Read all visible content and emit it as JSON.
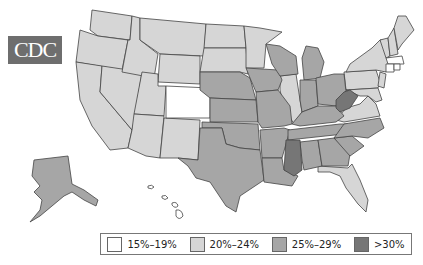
{
  "logo": {
    "text": "CDC"
  },
  "legend": {
    "items": [
      {
        "label": "15%–19%",
        "color": "#ffffff"
      },
      {
        "label": "20%–24%",
        "color": "#d6d6d6"
      },
      {
        "label": "25%–29%",
        "color": "#a6a6a6"
      },
      {
        "label": ">30%",
        "color": "#767676"
      }
    ]
  },
  "map": {
    "title": "",
    "categories": {
      "15-19": [
        "Colorado",
        "Massachusetts",
        "Connecticut",
        "Rhode Island",
        "Hawaii"
      ],
      "20-24": [
        "Washington",
        "Oregon",
        "California",
        "Nevada",
        "Idaho",
        "Montana",
        "Wyoming",
        "Utah",
        "Arizona",
        "New Mexico",
        "North Dakota",
        "South Dakota",
        "Minnesota",
        "Illinois",
        "Virginia",
        "Pennsylvania",
        "New York",
        "New Jersey",
        "Maryland",
        "Delaware",
        "Vermont",
        "New Hampshire",
        "Maine",
        "Florida"
      ],
      "25-29": [
        "Nebraska",
        "Kansas",
        "Oklahoma",
        "Texas",
        "Iowa",
        "Missouri",
        "Arkansas",
        "Louisiana",
        "Wisconsin",
        "Michigan",
        "Indiana",
        "Ohio",
        "Kentucky",
        "Tennessee",
        "Alabama",
        "Georgia",
        "South Carolina",
        "North Carolina",
        "Alaska"
      ],
      "30plus": [
        "Mississippi",
        "West Virginia"
      ]
    }
  }
}
